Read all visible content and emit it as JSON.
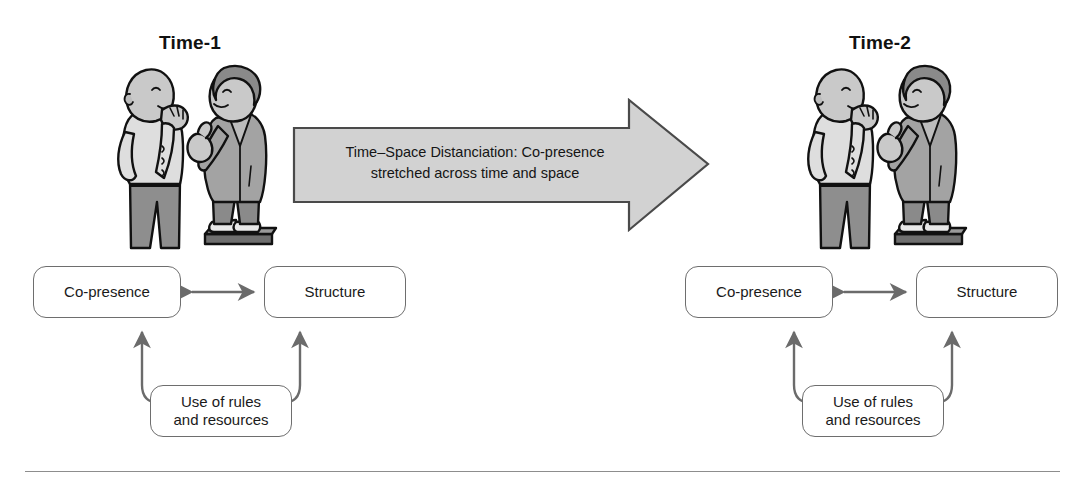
{
  "figure": {
    "time_panels": [
      {
        "id": "time1",
        "label": "Time-1"
      },
      {
        "id": "time2",
        "label": "Time-2"
      }
    ],
    "transition_arrow": {
      "line1": "Time–Space Distanciation: Co-presence",
      "line2": "stretched across time and space",
      "direction": "right",
      "fill_color": "#d2d2d2",
      "border_color": "#4a4a4a"
    },
    "structuration_cycle": {
      "nodes": {
        "copresence": "Co-presence",
        "structure": "Structure",
        "rules": "Use of rules\nand resources",
        "rules_line1": "Use of rules",
        "rules_line2": "and resources"
      },
      "links": [
        {
          "from": "copresence",
          "to": "structure",
          "style": "double-headed"
        },
        {
          "from": "rules",
          "to": "copresence",
          "style": "double-headed"
        },
        {
          "from": "rules",
          "to": "structure",
          "style": "double-headed"
        }
      ],
      "box_border_color": "#6e6e6e",
      "arrow_color": "#6b6b6b"
    },
    "people_scene": {
      "description": "two-people-conversation",
      "listener": "bald man in light shirt and dark trousers, hand raised to mouth",
      "speaker": "man in gray suit pointing, standing on a raised platform",
      "shirt_color": "#dcdcdc",
      "trousers_color": "#8f8f8f",
      "suit_color": "#a0a0a0",
      "platform_color": "#6f6f6f",
      "skin_color": "#c9c9c9"
    },
    "divider_color": "#8d8d8d"
  }
}
